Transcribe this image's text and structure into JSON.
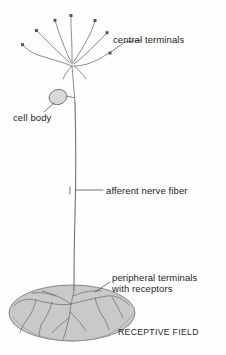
{
  "figure": {
    "background_color": "#fefefe",
    "stroke_color": "#6b6b6b",
    "text_color": "#231f20",
    "field_fill_color": "#c9c9c9",
    "soma_fill_color": "#d9d9d9"
  },
  "labels": {
    "central_terminals": "central terminals",
    "cell_body": "cell body",
    "afferent_nerve_fiber": "afferent nerve fiber",
    "peripheral_terminals_line1": "peripheral terminals",
    "peripheral_terminals_line2": "with receptors",
    "receptive_field": "RECEPTIVE FIELD"
  },
  "parts": {
    "central_terminal_count": 7,
    "soma_shape": "oval",
    "receptive_field_shape": "ellipse"
  }
}
